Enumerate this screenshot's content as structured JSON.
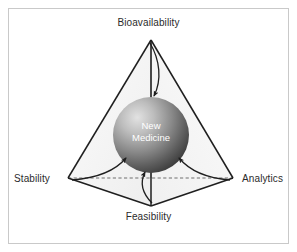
{
  "figure": {
    "background_color": "#ffffff",
    "border_color": "#c9c9c9",
    "width": 297,
    "height": 252
  },
  "core": {
    "name": "core-sphere",
    "line1": "New",
    "line2": "Medicine",
    "text_color": "#ffffff",
    "gradient_light": "#d8d8d8",
    "gradient_dark": "#4a4a4a",
    "center_x": 151,
    "center_y": 135,
    "radius": 38
  },
  "vertices": [
    {
      "id": "bioavailability",
      "label": "Bioavailability",
      "position": "top",
      "x": 151,
      "y": 40
    },
    {
      "id": "stability",
      "label": "Stability",
      "position": "left",
      "x": 68,
      "y": 178
    },
    {
      "id": "analytics",
      "label": "Analytics",
      "position": "right",
      "x": 233,
      "y": 178
    },
    {
      "id": "feasibility",
      "label": "Feasibility",
      "position": "bottom",
      "x": 151,
      "y": 206
    }
  ],
  "edges": {
    "solid_color": "#1f1f1f",
    "hidden_edge_style": "dashed",
    "hidden_edge_color": "#6e6e6e",
    "face_fill": "#f4f4f4"
  },
  "arrows": {
    "color": "#1f1f1f",
    "description": "Four curved arrows point inward from each vertex toward the central sphere",
    "items": [
      {
        "from": "bioavailability",
        "to": "core"
      },
      {
        "from": "stability",
        "to": "core"
      },
      {
        "from": "analytics",
        "to": "core"
      },
      {
        "from": "feasibility",
        "to": "core"
      }
    ]
  }
}
